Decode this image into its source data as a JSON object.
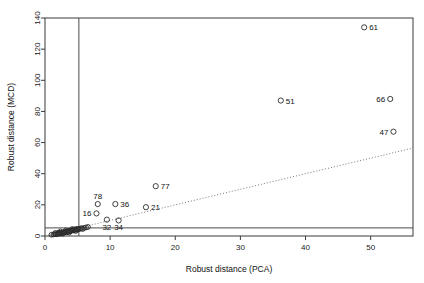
{
  "chart_data": {
    "type": "scatter",
    "title": "",
    "xlabel": "Robust distance (PCA)",
    "ylabel": "Robust distance (MCD)",
    "xlim": [
      0,
      56.5
    ],
    "ylim": [
      0,
      140
    ],
    "xticks": [
      0,
      10,
      20,
      30,
      40,
      50
    ],
    "yticks": [
      0,
      20,
      40,
      60,
      80,
      100,
      120,
      140
    ],
    "xticklabels": [
      "0",
      "10",
      "20",
      "30",
      "40",
      "50"
    ],
    "yticklabels": [
      "0",
      "20",
      "40",
      "60",
      "80",
      "100",
      "120",
      "140"
    ],
    "grid": false,
    "legend": null,
    "reference_lines": {
      "vertical_cutoff": 5.2,
      "horizontal_cutoff": 5.2,
      "diagonal_dotted": {
        "slope": 1,
        "intercept": 0,
        "note": "y = x reference"
      }
    },
    "labeled_points": [
      {
        "label": "61",
        "x": 49.0,
        "y": 134.0,
        "label_side": "right"
      },
      {
        "label": "66",
        "x": 53.0,
        "y": 88.0,
        "label_side": "left"
      },
      {
        "label": "47",
        "x": 53.5,
        "y": 67.0,
        "label_side": "left"
      },
      {
        "label": "51",
        "x": 36.2,
        "y": 87.0,
        "label_side": "right"
      },
      {
        "label": "77",
        "x": 17.0,
        "y": 32.0,
        "label_side": "right"
      },
      {
        "label": "21",
        "x": 15.5,
        "y": 18.5,
        "label_side": "right"
      },
      {
        "label": "36",
        "x": 10.8,
        "y": 20.5,
        "label_side": "right"
      },
      {
        "label": "78",
        "x": 8.1,
        "y": 20.5,
        "label_side": "above"
      },
      {
        "label": "16",
        "x": 7.9,
        "y": 14.5,
        "label_side": "left"
      },
      {
        "label": "32",
        "x": 9.5,
        "y": 10.5,
        "label_side": "below"
      },
      {
        "label": "34",
        "x": 11.3,
        "y": 10.0,
        "label_side": "below"
      }
    ],
    "unlabeled_points": [
      {
        "x": 1.0,
        "y": 0.8
      },
      {
        "x": 1.3,
        "y": 1.0
      },
      {
        "x": 1.5,
        "y": 1.2
      },
      {
        "x": 1.7,
        "y": 1.1
      },
      {
        "x": 1.9,
        "y": 1.5
      },
      {
        "x": 2.0,
        "y": 1.3
      },
      {
        "x": 2.2,
        "y": 1.8
      },
      {
        "x": 2.3,
        "y": 1.6
      },
      {
        "x": 2.5,
        "y": 2.0
      },
      {
        "x": 2.6,
        "y": 1.9
      },
      {
        "x": 2.8,
        "y": 2.3
      },
      {
        "x": 2.9,
        "y": 2.1
      },
      {
        "x": 3.0,
        "y": 2.5
      },
      {
        "x": 3.1,
        "y": 2.4
      },
      {
        "x": 3.3,
        "y": 2.8
      },
      {
        "x": 3.4,
        "y": 2.6
      },
      {
        "x": 3.5,
        "y": 3.0
      },
      {
        "x": 3.6,
        "y": 2.9
      },
      {
        "x": 3.8,
        "y": 3.3
      },
      {
        "x": 3.9,
        "y": 3.1
      },
      {
        "x": 4.0,
        "y": 3.5
      },
      {
        "x": 4.1,
        "y": 3.4
      },
      {
        "x": 4.3,
        "y": 3.8
      },
      {
        "x": 4.4,
        "y": 3.6
      },
      {
        "x": 4.5,
        "y": 4.0
      },
      {
        "x": 4.6,
        "y": 4.2
      },
      {
        "x": 4.8,
        "y": 4.4
      },
      {
        "x": 4.9,
        "y": 3.9
      },
      {
        "x": 5.0,
        "y": 4.6
      },
      {
        "x": 5.2,
        "y": 4.3
      },
      {
        "x": 5.4,
        "y": 4.8
      },
      {
        "x": 5.6,
        "y": 5.0
      },
      {
        "x": 5.8,
        "y": 4.5
      },
      {
        "x": 6.0,
        "y": 5.2
      },
      {
        "x": 6.3,
        "y": 5.5
      },
      {
        "x": 6.6,
        "y": 5.8
      },
      {
        "x": 2.1,
        "y": 2.2
      },
      {
        "x": 2.7,
        "y": 1.4
      },
      {
        "x": 3.2,
        "y": 3.6
      },
      {
        "x": 3.7,
        "y": 2.2
      },
      {
        "x": 4.2,
        "y": 4.5
      },
      {
        "x": 4.7,
        "y": 3.2
      },
      {
        "x": 1.6,
        "y": 2.0
      },
      {
        "x": 2.4,
        "y": 2.9
      }
    ]
  }
}
